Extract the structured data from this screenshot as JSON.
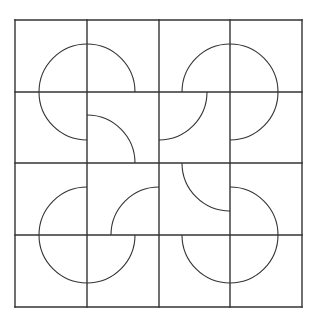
{
  "diagram": {
    "title": "",
    "background": "#ffffff",
    "stroke_color": "#333333",
    "grid": {
      "rows": 4,
      "cols": 4,
      "x_lines": [
        15,
        87,
        159,
        230,
        302
      ],
      "y_lines": [
        20,
        92,
        163,
        235,
        307
      ],
      "grid_stroke_width": 1.4
    },
    "arc_radius": 48,
    "arc_stroke_width": 1.1,
    "arcs": [
      {
        "cx": 87,
        "cy": 92,
        "quadrant": "upper-left"
      },
      {
        "cx": 87,
        "cy": 92,
        "quadrant": "upper-right"
      },
      {
        "cx": 87,
        "cy": 92,
        "quadrant": "lower-left"
      },
      {
        "cx": 230,
        "cy": 92,
        "quadrant": "upper-left"
      },
      {
        "cx": 230,
        "cy": 92,
        "quadrant": "upper-right"
      },
      {
        "cx": 230,
        "cy": 92,
        "quadrant": "lower-right"
      },
      {
        "cx": 87,
        "cy": 163,
        "quadrant": "upper-right"
      },
      {
        "cx": 159,
        "cy": 92,
        "quadrant": "lower-right"
      },
      {
        "cx": 159,
        "cy": 235,
        "quadrant": "upper-left"
      },
      {
        "cx": 230,
        "cy": 163,
        "quadrant": "lower-left"
      },
      {
        "cx": 87,
        "cy": 235,
        "quadrant": "upper-left"
      },
      {
        "cx": 87,
        "cy": 235,
        "quadrant": "lower-left"
      },
      {
        "cx": 87,
        "cy": 235,
        "quadrant": "lower-right"
      },
      {
        "cx": 230,
        "cy": 235,
        "quadrant": "upper-right"
      },
      {
        "cx": 230,
        "cy": 235,
        "quadrant": "lower-right"
      },
      {
        "cx": 230,
        "cy": 235,
        "quadrant": "lower-left"
      }
    ]
  }
}
